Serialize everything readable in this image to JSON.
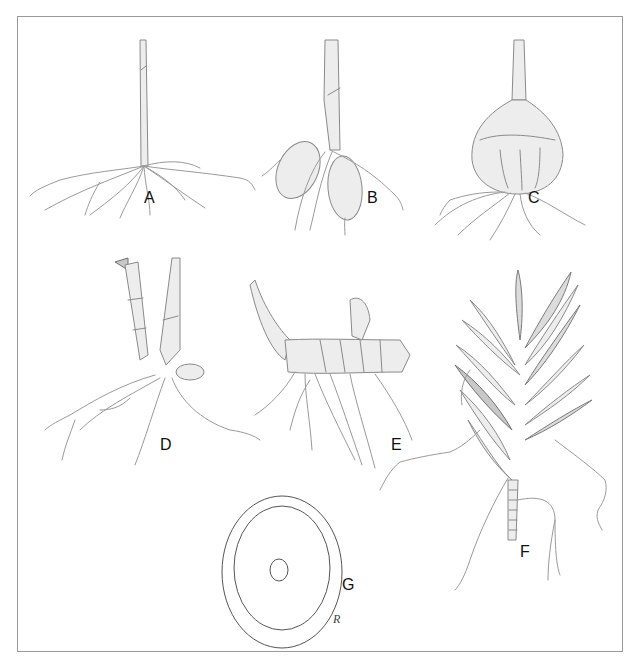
{
  "figure": {
    "type": "botanical illustration",
    "panels": [
      {
        "id": "A",
        "label": "A",
        "subject": "fibrous root system with single stem"
      },
      {
        "id": "B",
        "label": "B",
        "subject": "stem with two tuberous roots"
      },
      {
        "id": "C",
        "label": "C",
        "subject": "bulb with roots"
      },
      {
        "id": "D",
        "label": "D",
        "subject": "segmented stems with roots"
      },
      {
        "id": "E",
        "label": "E",
        "subject": "horizontal rhizome with roots"
      },
      {
        "id": "F",
        "label": "F",
        "subject": "leafy shoot with aerial roots"
      },
      {
        "id": "G",
        "label": "G",
        "subject": "root cross-section"
      }
    ],
    "signature": "R"
  },
  "colors": {
    "background": "#ffffff",
    "frame": "#9a9a9a",
    "line": "#8a8a8a",
    "label": "#111111"
  }
}
